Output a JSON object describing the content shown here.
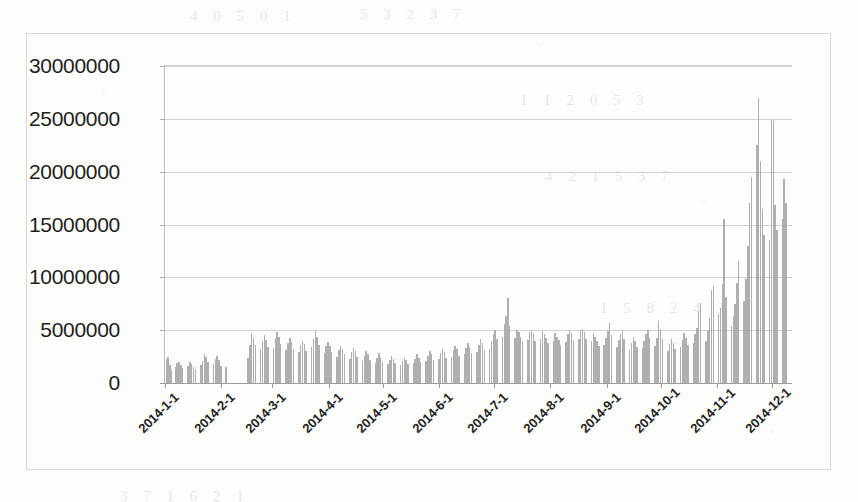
{
  "chart_data": {
    "type": "bar",
    "title": "",
    "subtitle": "",
    "xlabel": "",
    "ylabel": "",
    "ylim": [
      0,
      30000000
    ],
    "ytick_labels": [
      "30000000",
      "25000000",
      "20000000",
      "15000000",
      "10000000",
      "5000000",
      "0"
    ],
    "ytick_values": [
      30000000,
      25000000,
      20000000,
      15000000,
      10000000,
      5000000,
      0
    ],
    "ytick_step": 5000000,
    "grid": true,
    "legend": "none",
    "legend_position": "none",
    "bar_color": "#9e9e9e",
    "axis_color": "#9c9c9c",
    "gridline_color": "#d2d2d2",
    "x_axis_type": "daily-dates",
    "xtick_labels": [
      "2014-1-1",
      "2014-2-1",
      "2014-3-1",
      "2014-4-1",
      "2014-5-1",
      "2014-6-1",
      "2014-7-1",
      "2014-8-1",
      "2014-9-1",
      "2014-10-1",
      "2014-11-1",
      "2014-12-1"
    ],
    "xtick_indices": [
      0,
      31,
      59,
      90,
      120,
      151,
      181,
      212,
      243,
      273,
      304,
      334
    ],
    "n_points": 365,
    "categories_note": "One bar per day of 2014; labeled ticks mark the first of each month.",
    "values": [
      2300000,
      2500000,
      1700000,
      1200000,
      0,
      1500000,
      1900000,
      2000000,
      1700000,
      1400000,
      0,
      0,
      1600000,
      2000000,
      1800000,
      1500000,
      1300000,
      0,
      0,
      1700000,
      2100000,
      2700000,
      2500000,
      2000000,
      0,
      0,
      1800000,
      2300000,
      2600000,
      2200000,
      1600000,
      0,
      0,
      1500000,
      0,
      0,
      0,
      0,
      0,
      0,
      0,
      0,
      0,
      0,
      0,
      2400000,
      3600000,
      4700000,
      4300000,
      3600000,
      0,
      0,
      3200000,
      4000000,
      4500000,
      4100000,
      3400000,
      0,
      0,
      3300000,
      4300000,
      4800000,
      4400000,
      3700000,
      0,
      0,
      3100000,
      3800000,
      4300000,
      3900000,
      3200000,
      0,
      0,
      2900000,
      3600000,
      4000000,
      3700000,
      3000000,
      0,
      0,
      3400000,
      4200000,
      4900000,
      4400000,
      3600000,
      0,
      0,
      2800000,
      3500000,
      3900000,
      3500000,
      2900000,
      0,
      0,
      2500000,
      3100000,
      3500000,
      3200000,
      2700000,
      0,
      0,
      2300000,
      2900000,
      3300000,
      3000000,
      2500000,
      0,
      0,
      2100000,
      2600000,
      3000000,
      2700000,
      2200000,
      0,
      0,
      1900000,
      2400000,
      2800000,
      2500000,
      2000000,
      0,
      0,
      1800000,
      2200000,
      2600000,
      2300000,
      1900000,
      0,
      0,
      1700000,
      2100000,
      2400000,
      2200000,
      1800000,
      0,
      0,
      1900000,
      2300000,
      2700000,
      2400000,
      2000000,
      0,
      0,
      2100000,
      2600000,
      3000000,
      2700000,
      2200000,
      0,
      0,
      2300000,
      2800000,
      3200000,
      2900000,
      2400000,
      0,
      0,
      2500000,
      3100000,
      3500000,
      3200000,
      2600000,
      0,
      0,
      2700000,
      3300000,
      3800000,
      3400000,
      2800000,
      0,
      0,
      2900000,
      3600000,
      4200000,
      3800000,
      3100000,
      0,
      0,
      3200000,
      4000000,
      4600000,
      5000000,
      4200000,
      0,
      0,
      4400000,
      5600000,
      6300000,
      8000000,
      5400000,
      0,
      0,
      4300000,
      5000000,
      4800000,
      4400000,
      3900000,
      0,
      0,
      4100000,
      4800000,
      5000000,
      4700000,
      4000000,
      0,
      0,
      4200000,
      4900000,
      4600000,
      4300000,
      3800000,
      0,
      0,
      4000000,
      4700000,
      4400000,
      4100000,
      3600000,
      0,
      0,
      3900000,
      4600000,
      5000000,
      4700000,
      4100000,
      0,
      0,
      4200000,
      5000000,
      5100000,
      4800000,
      4200000,
      0,
      0,
      4000000,
      4700000,
      4400000,
      4000000,
      3500000,
      0,
      0,
      3600000,
      4300000,
      4900000,
      5700000,
      4500000,
      0,
      0,
      3400000,
      4100000,
      4600000,
      4900000,
      4200000,
      0,
      0,
      3100000,
      3800000,
      4400000,
      4000000,
      3400000,
      0,
      0,
      3300000,
      4000000,
      4600000,
      5000000,
      4300000,
      0,
      0,
      3500000,
      4300000,
      5900000,
      5100000,
      4200000,
      0,
      0,
      3000000,
      3700000,
      4200000,
      3800000,
      3200000,
      0,
      0,
      3400000,
      4100000,
      4700000,
      4300000,
      3600000,
      0,
      0,
      3800000,
      4600000,
      5200000,
      6800000,
      7600000,
      0,
      0,
      4000000,
      4900000,
      6200000,
      8800000,
      9200000,
      0,
      0,
      6500000,
      7100000,
      9400000,
      15500000,
      8100000,
      0,
      0,
      5400000,
      6300000,
      7500000,
      9500000,
      11500000,
      0,
      0,
      7800000,
      9800000,
      13000000,
      17000000,
      19500000,
      0,
      0,
      22500000,
      27000000,
      21000000,
      16500000,
      14000000,
      0,
      0,
      13500000,
      24900000,
      24800000,
      16800000,
      14500000,
      0,
      0,
      15500000,
      19300000,
      17000000,
      0,
      0,
      0
    ],
    "annotations": [
      {
        "text": "flat baseline ~2M/day in Jan",
        "x_index": 10,
        "y": 2000000
      },
      {
        "text": "mid-year plateau ~4-5M/day",
        "x_index": 220,
        "y": 4500000
      },
      {
        "text": "steep year-end ramp",
        "x_index": 330,
        "y": 20000000
      },
      {
        "text": "peak ~27M",
        "x_index": 336,
        "y": 27000000
      }
    ]
  },
  "page": {
    "background_color": "#fdfdfc",
    "frame_color": "#d8d8d8",
    "bleed_text": [
      "4 0 5 0 1",
      "5 3 2 3 7",
      "1 1 2 0 5 3",
      "4 2 1 5 3 7",
      "3 7 1 6 2 1",
      "1 5 8 2 4 3"
    ]
  }
}
